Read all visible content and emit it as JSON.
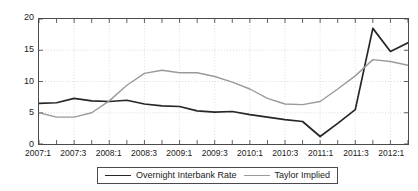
{
  "chart_data": {
    "type": "line",
    "title": "",
    "xlabel": "",
    "ylabel": "",
    "ylim": [
      0,
      20
    ],
    "yticks": [
      0,
      5,
      10,
      15,
      20
    ],
    "grid": true,
    "legend_position": "bottom-center",
    "x": [
      "2007:1",
      "2007:2",
      "2007:3",
      "2007:4",
      "2008:1",
      "2008:2",
      "2008:3",
      "2008:4",
      "2009:1",
      "2009:2",
      "2009:3",
      "2009:4",
      "2010:1",
      "2010:2",
      "2010:3",
      "2010:4",
      "2011:1",
      "2011:2",
      "2011:3",
      "2011:4",
      "2012:1",
      "2012:2"
    ],
    "xtick_labels": [
      "2007:1",
      "2007:3",
      "2008:1",
      "2008:3",
      "2009:1",
      "2009:3",
      "2010:1",
      "2010:3",
      "2011:1",
      "2011:3",
      "2012:1"
    ],
    "categories": [
      "2007:1",
      "2007:2",
      "2007:3",
      "2007:4",
      "2008:1",
      "2008:2",
      "2008:3",
      "2008:4",
      "2009:1",
      "2009:2",
      "2009:3",
      "2009:4",
      "2010:1",
      "2010:2",
      "2010:3",
      "2010:4",
      "2011:1",
      "2011:2",
      "2011:3",
      "2011:4",
      "2012:1",
      "2012:2"
    ],
    "series": [
      {
        "name": "Overnight Interbank Rate",
        "color": "#262626",
        "width": 1.7,
        "values": [
          6.5,
          6.6,
          7.3,
          6.9,
          6.8,
          7.0,
          6.4,
          6.1,
          6.0,
          5.3,
          5.1,
          5.2,
          4.7,
          4.3,
          3.9,
          3.6,
          1.2,
          3.3,
          5.5,
          18.5,
          14.8,
          16.2
        ]
      },
      {
        "name": "Taylor Implied",
        "color": "#9a9a9a",
        "width": 1.4,
        "values": [
          5.0,
          4.3,
          4.3,
          5.0,
          6.9,
          9.4,
          11.3,
          11.8,
          11.4,
          11.4,
          10.8,
          9.9,
          8.8,
          7.3,
          6.4,
          6.3,
          6.8,
          8.8,
          10.9,
          13.5,
          13.2,
          12.6
        ]
      }
    ]
  },
  "legend": {
    "entries": [
      {
        "label": "Overnight Interbank Rate"
      },
      {
        "label": "Taylor Implied"
      }
    ]
  }
}
